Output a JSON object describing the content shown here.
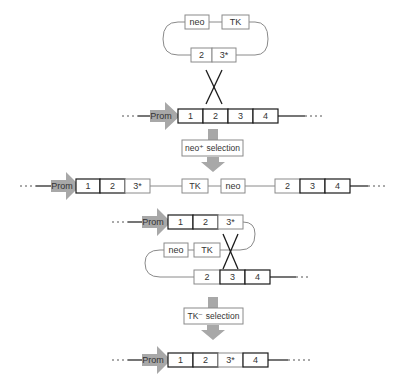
{
  "figure": {
    "colors": {
      "promoter_arrow": "#a8a8a8",
      "selection_arrow": "#a8a8a8",
      "dark_outline": "#1a1a1a",
      "light_outline": "#8a8a8a"
    }
  },
  "plasmid": {
    "top_boxes": [
      {
        "label": "neo"
      },
      {
        "label": "TK"
      }
    ],
    "bottom_boxes": [
      {
        "label": "2"
      },
      {
        "label": "3*"
      }
    ]
  },
  "genome_row1": {
    "promoter": "Prom",
    "exons": [
      {
        "label": "1"
      },
      {
        "label": "2"
      },
      {
        "label": "3"
      },
      {
        "label": "4"
      }
    ]
  },
  "selection1": {
    "label": "neo⁺ selection"
  },
  "integrated_row": {
    "promoter": "Prom",
    "left_exons": [
      {
        "label": "1"
      },
      {
        "label": "2"
      },
      {
        "label": "3*"
      }
    ],
    "markers": [
      {
        "label": "TK"
      },
      {
        "label": "neo"
      }
    ],
    "right_exons": [
      {
        "label": "2"
      },
      {
        "label": "3"
      },
      {
        "label": "4"
      }
    ]
  },
  "loop_row": {
    "promoter": "Prom",
    "upper_exons": [
      {
        "label": "1"
      },
      {
        "label": "2"
      },
      {
        "label": "3*"
      }
    ],
    "markers": [
      {
        "label": "neo"
      },
      {
        "label": "TK"
      }
    ],
    "lower_exons": [
      {
        "label": "2"
      },
      {
        "label": "3"
      },
      {
        "label": "4"
      }
    ]
  },
  "selection2": {
    "label": "TK⁻ selection"
  },
  "final_row": {
    "promoter": "Prom",
    "exons": [
      {
        "label": "1"
      },
      {
        "label": "2"
      },
      {
        "label": "3*"
      },
      {
        "label": "4"
      }
    ]
  }
}
